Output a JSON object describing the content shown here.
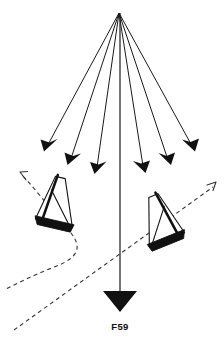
{
  "figure": {
    "caption": "F59",
    "caption_position": {
      "x": 120,
      "y": 327
    },
    "background_color": "#ffffff",
    "ink_color": "#111111",
    "dash_color": "#333333",
    "width": 224,
    "height": 339
  },
  "wind_source": {
    "label": "wind-origin-apex",
    "x": 119,
    "y": 13
  },
  "wind_arrows": [
    {
      "name": "wind-arrow-far-left",
      "x1": 119,
      "y1": 13,
      "x2": 44,
      "y2": 148,
      "angle_deg": 209
    },
    {
      "name": "wind-arrow-left",
      "x1": 119,
      "y1": 13,
      "x2": 68,
      "y2": 162,
      "angle_deg": 199
    },
    {
      "name": "wind-arrow-mid-left",
      "x1": 119,
      "y1": 13,
      "x2": 95,
      "y2": 171,
      "angle_deg": 189
    },
    {
      "name": "wind-arrow-mid-right",
      "x1": 119,
      "y1": 13,
      "x2": 145,
      "y2": 170,
      "angle_deg": 171
    },
    {
      "name": "wind-arrow-right",
      "x1": 119,
      "y1": 13,
      "x2": 170,
      "y2": 162,
      "angle_deg": 161
    },
    {
      "name": "wind-arrow-far-right",
      "x1": 119,
      "y1": 13,
      "x2": 195,
      "y2": 148,
      "angle_deg": 151
    }
  ],
  "main_axis": {
    "name": "wind-direction-axis",
    "x1": 120,
    "y1": 13,
    "x2": 120,
    "y2": 292,
    "arrowhead_tip": {
      "x": 120,
      "y": 311
    },
    "arrowhead_width": 34
  },
  "boats": [
    {
      "name": "sailboat-left",
      "position": {
        "x": 55,
        "y": 205
      },
      "heel": "port",
      "rotation_deg": 14
    },
    {
      "name": "sailboat-right",
      "position": {
        "x": 163,
        "y": 222
      },
      "heel": "starboard",
      "rotation_deg": -22
    }
  ],
  "tracks": [
    {
      "name": "track-left-boat",
      "style": "dashed",
      "description": "curved wake behind left boat looping to lower right",
      "arrow_tip": {
        "x": 20,
        "y": 172
      }
    },
    {
      "name": "track-right-boat",
      "style": "dashed",
      "description": "long diagonal from lower left up through right boat",
      "arrow_tip": {
        "x": 216,
        "y": 182
      }
    }
  ]
}
